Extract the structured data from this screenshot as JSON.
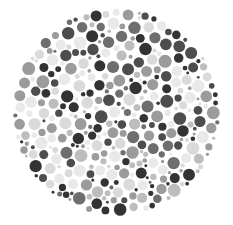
{
  "figure": {
    "type": "dot-plate",
    "palette": [
      "#333333",
      "#4d4d4d",
      "#6e6e6e",
      "#9b9b9b",
      "#bdbdbd",
      "#dadada",
      "#e9e9e9"
    ],
    "palette_weights": [
      0.16,
      0.14,
      0.08,
      0.16,
      0.14,
      0.18,
      0.14
    ],
    "background": "#ffffff",
    "seed": 1337
  }
}
